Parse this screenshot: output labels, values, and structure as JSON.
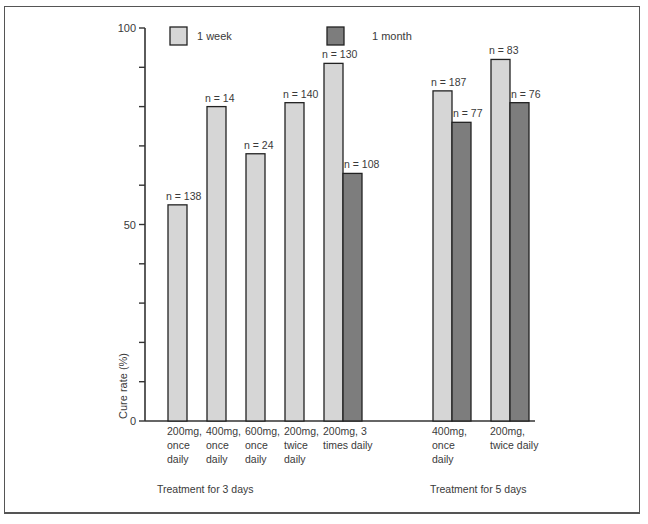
{
  "chart_data": {
    "type": "bar",
    "title": "",
    "xlabel": "",
    "ylabel": "Cure rate (%)",
    "ylim": [
      0,
      100
    ],
    "yticks": [
      0,
      10,
      20,
      30,
      40,
      50,
      60,
      70,
      80,
      90,
      100
    ],
    "ytick_labels": [
      "0",
      "50",
      "100"
    ],
    "grid": false,
    "legend": {
      "position": "top",
      "entries": [
        {
          "name": "1 week",
          "color": "#d6d6d6"
        },
        {
          "name": "1 month",
          "color": "#7d7d7d"
        }
      ]
    },
    "groups": [
      {
        "label": "Treatment for 3 days",
        "categories": [
          {
            "label": [
              "200mg,",
              "once",
              "daily"
            ],
            "bars": [
              {
                "series": "1 week",
                "value": 55,
                "n": "n = 138"
              }
            ]
          },
          {
            "label": [
              "400mg,",
              "once",
              "daily"
            ],
            "bars": [
              {
                "series": "1 week",
                "value": 80,
                "n": "n = 14"
              }
            ]
          },
          {
            "label": [
              "600mg,",
              "once",
              "daily"
            ],
            "bars": [
              {
                "series": "1 week",
                "value": 68,
                "n": "n = 24"
              }
            ]
          },
          {
            "label": [
              "200mg,",
              "twice",
              "daily"
            ],
            "bars": [
              {
                "series": "1 week",
                "value": 81,
                "n": "n = 140"
              }
            ]
          },
          {
            "label": [
              "200mg, 3",
              "times daily"
            ],
            "bars": [
              {
                "series": "1 week",
                "value": 91,
                "n": "n = 130"
              },
              {
                "series": "1 month",
                "value": 63,
                "n": "n = 108"
              }
            ]
          }
        ]
      },
      {
        "label": "Treatment for 5 days",
        "categories": [
          {
            "label": [
              "400mg,",
              "once",
              "daily"
            ],
            "bars": [
              {
                "series": "1 week",
                "value": 84,
                "n": "n = 187"
              },
              {
                "series": "1 month",
                "value": 76,
                "n": "n = 77"
              }
            ]
          },
          {
            "label": [
              "200mg,",
              "twice daily"
            ],
            "bars": [
              {
                "series": "1 week",
                "value": 92,
                "n": "n = 83"
              },
              {
                "series": "1 month",
                "value": 81,
                "n": "n = 76"
              }
            ]
          }
        ]
      }
    ]
  }
}
